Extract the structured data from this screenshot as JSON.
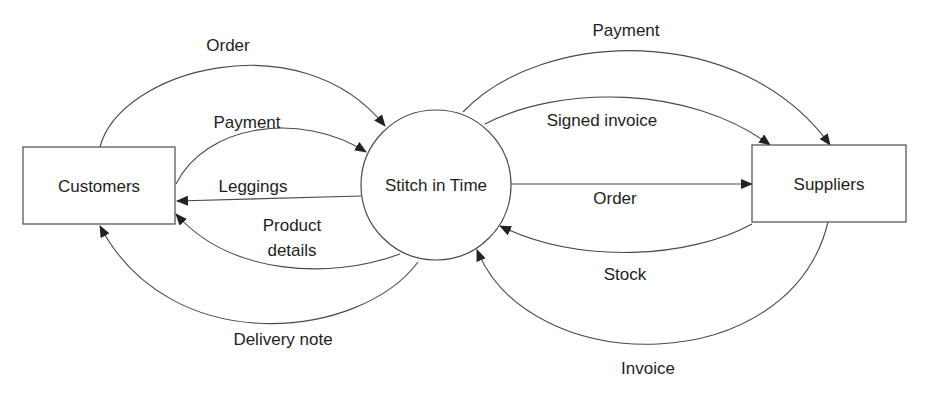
{
  "diagram": {
    "type": "context data flow diagram",
    "background": "#ffffff",
    "line_color": "#4a4a4a",
    "text_color": "#1e1e1e",
    "entities": [
      {
        "id": "customers",
        "label": "Customers",
        "shape": "rectangle"
      },
      {
        "id": "suppliers",
        "label": "Suppliers",
        "shape": "rectangle"
      }
    ],
    "process": {
      "id": "stitch",
      "label": "Stitch in Time",
      "shape": "circle"
    },
    "flows": [
      {
        "label": "Order",
        "from": "Customers",
        "to": "Stitch in Time"
      },
      {
        "label": "Payment",
        "from": "Customers",
        "to": "Stitch in Time"
      },
      {
        "label": "Leggings",
        "from": "Stitch in Time",
        "to": "Customers"
      },
      {
        "label_line1": "Product",
        "label_line2": "details",
        "label": "Product details",
        "from": "Stitch in Time",
        "to": "Customers"
      },
      {
        "label": "Delivery note",
        "from": "Stitch in Time",
        "to": "Customers"
      },
      {
        "label": "Payment",
        "from": "Stitch in Time",
        "to": "Suppliers"
      },
      {
        "label": "Signed invoice",
        "from": "Stitch in Time",
        "to": "Suppliers"
      },
      {
        "label": "Order",
        "from": "Stitch in Time",
        "to": "Suppliers"
      },
      {
        "label": "Stock",
        "from": "Suppliers",
        "to": "Stitch in Time"
      },
      {
        "label": "Invoice",
        "from": "Suppliers",
        "to": "Stitch in Time"
      }
    ]
  }
}
